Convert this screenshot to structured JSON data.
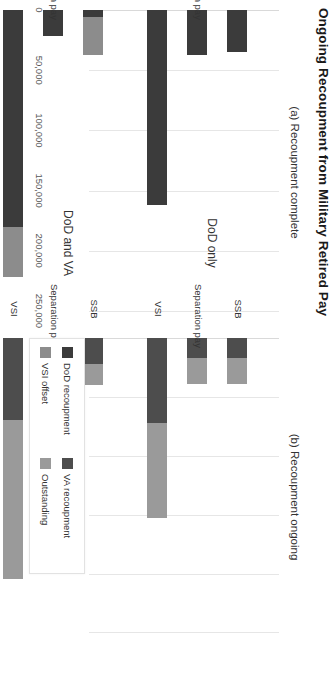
{
  "figure": {
    "title": "Ongoing Recoupment from Military Retired Pay"
  },
  "panels": [
    {
      "id": "a",
      "label": "(a) Recoupment complete"
    },
    {
      "id": "b",
      "label": "(b) Recoupment ongoing"
    }
  ],
  "groups": [
    {
      "id": "dod-only",
      "label": "DoD only"
    },
    {
      "id": "dod-and-va",
      "label": "DoD and VA"
    }
  ],
  "categories": [
    "SSB",
    "Separation pay",
    "VSI"
  ],
  "axis": {
    "ticks": [
      0,
      50000,
      100000,
      150000,
      200000,
      250000
    ],
    "tick_labels": [
      "0",
      "50,000",
      "100,000",
      "150,000",
      "200,000",
      "250,000"
    ],
    "min": 0,
    "max": 270000
  },
  "legend": {
    "items": [
      {
        "name": "dod-recoupment",
        "label": "DoD recoupment",
        "color": "#3b3b3b"
      },
      {
        "name": "va-recoupment",
        "label": "VA recoupment",
        "color": "#4d4d4d"
      },
      {
        "name": "vsi-offset",
        "label": "VSI offset",
        "color": "#8c8c8c"
      },
      {
        "name": "outstanding",
        "label": "Outstanding",
        "color": "#9a9a9a"
      }
    ]
  },
  "chart_data": {
    "type": "bar",
    "title": "Ongoing Recoupment from Military Retired Pay",
    "orientation": "horizontal",
    "stacked": true,
    "xlabel": "",
    "ylabel": "",
    "xlim": [
      0,
      270000
    ],
    "grid": true,
    "legend_position": "bottom-right",
    "panels": [
      {
        "label": "(a) Recoupment complete",
        "categories": [
          "DoD only / SSB",
          "DoD only / Separation pay",
          "DoD only / VSI",
          "DoD and VA / SSB",
          "DoD and VA / Separation pay",
          "DoD and VA / VSI"
        ],
        "series": [
          {
            "name": "DoD recoupment",
            "color": "#3b3b3b",
            "values": [
              35000,
              37000,
              162000,
              6000,
              22000,
              180000
            ]
          },
          {
            "name": "VSI offset",
            "color": "#8c8c8c",
            "values": [
              0,
              0,
              0,
              31000,
              0,
              42000
            ]
          },
          {
            "name": "VA recoupment",
            "color": "#4d4d4d",
            "values": [
              0,
              0,
              0,
              0,
              0,
              0
            ]
          },
          {
            "name": "Outstanding",
            "color": "#9a9a9a",
            "values": [
              0,
              0,
              0,
              0,
              0,
              0
            ]
          }
        ]
      },
      {
        "label": "(b) Recoupment ongoing",
        "categories": [
          "DoD only / SSB",
          "DoD only / Separation pay",
          "DoD only / VSI",
          "DoD and VA / SSB",
          "DoD and VA / Separation pay",
          "DoD and VA / VSI"
        ],
        "series": [
          {
            "name": "VA recoupment",
            "color": "#4d4d4d",
            "values": [
              17000,
              17000,
              72000,
              22000,
              20000,
              70000
            ]
          },
          {
            "name": "Outstanding",
            "color": "#9a9a9a",
            "values": [
              22000,
              22000,
              81000,
              18000,
              17000,
              135000
            ]
          }
        ]
      }
    ]
  }
}
